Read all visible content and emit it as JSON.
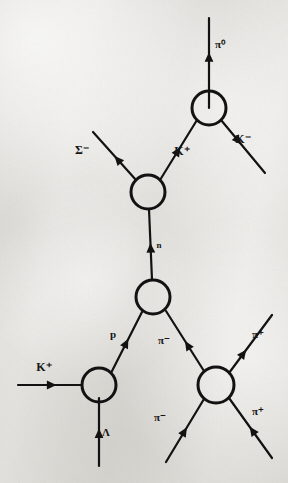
{
  "figure": {
    "width": 288,
    "height": 483,
    "background_color": "#e8e7e3",
    "ink_color": "#121212",
    "line_width": 2.2,
    "blob_radius": 17,
    "blob_stroke_width": 3.0
  },
  "vertices": [
    {
      "id": "v1",
      "name": "top-blob",
      "cx": 209,
      "cy": 108,
      "r": 17
    },
    {
      "id": "v2",
      "name": "sigma-blob",
      "cx": 148,
      "cy": 192,
      "r": 17
    },
    {
      "id": "v3",
      "name": "middle-blob",
      "cx": 153,
      "cy": 297,
      "r": 17
    },
    {
      "id": "v4",
      "name": "kaon-proton-blob",
      "cx": 99,
      "cy": 385,
      "r": 17
    },
    {
      "id": "v5",
      "name": "pion-blob",
      "cx": 216,
      "cy": 385,
      "r": 18
    }
  ],
  "lines": [
    {
      "id": "l1",
      "name": "pi-zero-outgoing",
      "x1": 209,
      "y1": 108,
      "x2": 209,
      "y2": 18,
      "arrow_t": 0.62,
      "label": "π⁰",
      "label_x": 220,
      "label_y": 48,
      "label_size": 11
    },
    {
      "id": "l2",
      "name": "k-minus-outgoing",
      "x1": 221,
      "y1": 120,
      "x2": 265,
      "y2": 173,
      "arrow_t": 0.46,
      "label": "K⁻",
      "label_x": 243,
      "label_y": 143,
      "label_size": 12
    },
    {
      "id": "l3",
      "name": "k-plus-internal",
      "x1": 160,
      "y1": 180,
      "x2": 197,
      "y2": 120,
      "arrow_t": 0.55,
      "label": "K⁺",
      "label_x": 182,
      "label_y": 155,
      "label_size": 12
    },
    {
      "id": "l4",
      "name": "sigma-minus-outgoing",
      "x1": 136,
      "y1": 180,
      "x2": 93,
      "y2": 132,
      "arrow_t": 0.5,
      "label": "Σ⁻",
      "label_x": 82,
      "label_y": 154,
      "label_size": 12
    },
    {
      "id": "l5",
      "name": "neutron-internal",
      "x1": 152,
      "y1": 280,
      "x2": 149,
      "y2": 209,
      "arrow_t": 0.52,
      "label": "n",
      "label_x": 159,
      "label_y": 248,
      "label_size": 9
    },
    {
      "id": "l6",
      "name": "proton-internal",
      "x1": 111,
      "y1": 373,
      "x2": 142,
      "y2": 312,
      "arrow_t": 0.56,
      "label": "p",
      "label_x": 113,
      "label_y": 338,
      "label_size": 11
    },
    {
      "id": "l7",
      "name": "pi-minus-internal",
      "x1": 204,
      "y1": 371,
      "x2": 166,
      "y2": 311,
      "arrow_t": 0.5,
      "label": "π⁻",
      "label_x": 164,
      "label_y": 344,
      "label_size": 11
    },
    {
      "id": "l8",
      "name": "k-plus-incoming",
      "x1": 18,
      "y1": 385,
      "x2": 82,
      "y2": 385,
      "arrow_t": 0.6,
      "label": "K⁺",
      "label_x": 44,
      "label_y": 371,
      "label_size": 12
    },
    {
      "id": "l9",
      "name": "lambda-incoming",
      "x1": 99,
      "y1": 466,
      "x2": 99,
      "y2": 398,
      "arrow_t": 0.55,
      "label": "Λ",
      "label_x": 106,
      "label_y": 436,
      "label_size": 11
    },
    {
      "id": "l10",
      "name": "pi-plus-outgoing-upper",
      "x1": 229,
      "y1": 373,
      "x2": 272,
      "y2": 315,
      "arrow_t": 0.4,
      "label": "π⁺",
      "label_x": 258,
      "label_y": 338,
      "label_size": 11
    },
    {
      "id": "l11",
      "name": "pi-minus-incoming-lower",
      "x1": 166,
      "y1": 462,
      "x2": 204,
      "y2": 399,
      "arrow_t": 0.55,
      "label": "π⁻",
      "label_x": 160,
      "label_y": 421,
      "label_size": 11
    },
    {
      "id": "l12",
      "name": "pi-plus-outgoing-lower",
      "x1": 272,
      "y1": 458,
      "x2": 229,
      "y2": 398,
      "arrow_t": 0.52,
      "label": "π⁺",
      "label_x": 258,
      "label_y": 415,
      "label_size": 11
    }
  ],
  "chart_data": {
    "type": "diagram",
    "nodes": [
      {
        "name": "top-blob",
        "position": [
          209,
          108
        ]
      },
      {
        "name": "sigma-blob",
        "position": [
          148,
          192
        ]
      },
      {
        "name": "middle-blob",
        "position": [
          153,
          297
        ]
      },
      {
        "name": "kaon-proton-blob",
        "position": [
          99,
          385
        ]
      },
      {
        "name": "pion-blob",
        "position": [
          216,
          385
        ]
      }
    ],
    "edges": [
      {
        "particle": "π⁰",
        "from": "top-blob",
        "to": "external-up",
        "direction": "outgoing"
      },
      {
        "particle": "K⁻",
        "from": "top-blob",
        "to": "external-down-right",
        "direction": "outgoing"
      },
      {
        "particle": "K⁺",
        "from": "sigma-blob",
        "to": "top-blob",
        "direction": "internal"
      },
      {
        "particle": "Σ⁻",
        "from": "sigma-blob",
        "to": "external-up-left",
        "direction": "outgoing"
      },
      {
        "particle": "n",
        "from": "middle-blob",
        "to": "sigma-blob",
        "direction": "internal"
      },
      {
        "particle": "p",
        "from": "kaon-proton-blob",
        "to": "middle-blob",
        "direction": "internal"
      },
      {
        "particle": "π⁻",
        "from": "pion-blob",
        "to": "middle-blob",
        "direction": "internal"
      },
      {
        "particle": "K⁺",
        "from": "external-left",
        "to": "kaon-proton-blob",
        "direction": "incoming"
      },
      {
        "particle": "Λ",
        "from": "external-bottom",
        "to": "kaon-proton-blob",
        "direction": "incoming"
      },
      {
        "particle": "π⁺",
        "from": "pion-blob",
        "to": "external-up-right",
        "direction": "outgoing"
      },
      {
        "particle": "π⁻",
        "from": "external-bottom-left",
        "to": "pion-blob",
        "direction": "incoming"
      },
      {
        "particle": "π⁺",
        "from": "pion-blob",
        "to": "external-bottom-right",
        "direction": "outgoing"
      }
    ]
  }
}
